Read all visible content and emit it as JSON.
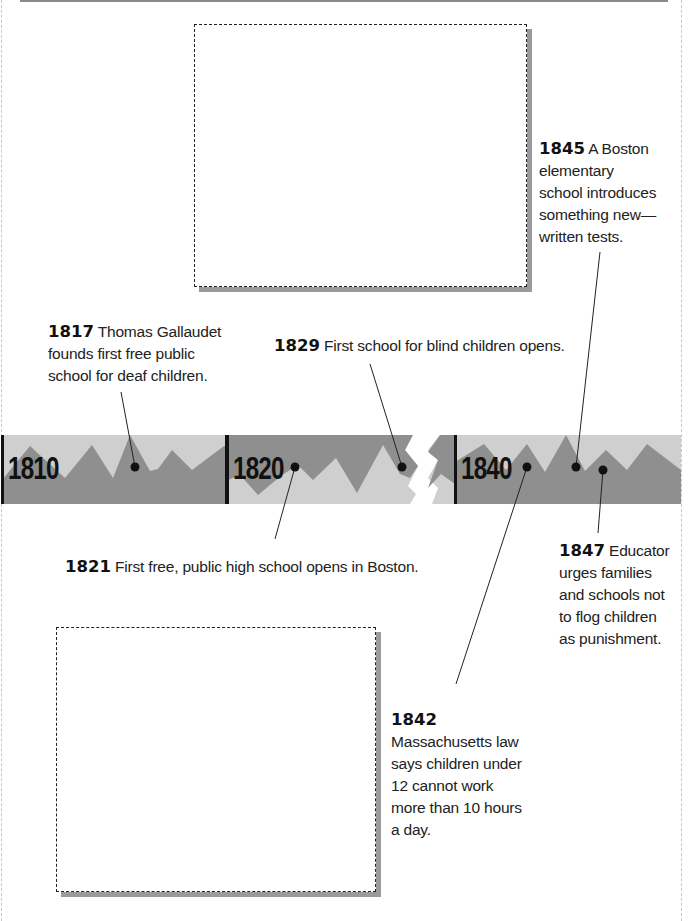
{
  "frame": {
    "border_color": "#c8c8c8",
    "top_rule_color": "#8a8a8a"
  },
  "photo_placeholders": [
    {
      "id": "top-photo",
      "x": 194,
      "y": 24,
      "w": 333,
      "h": 263
    },
    {
      "id": "bottom-photo",
      "x": 56,
      "y": 627,
      "w": 320,
      "h": 265
    }
  ],
  "timeline": {
    "colors": {
      "light": "#cfcfcf",
      "dark": "#8f8f8f",
      "bar": "#111111",
      "dot": "#111111"
    },
    "decades": [
      {
        "label": "1810"
      },
      {
        "label": "1820"
      },
      {
        "label": "1840"
      }
    ]
  },
  "events": [
    {
      "year": "1817",
      "text": "Thomas Gallaudet founds first free public school for deaf children.",
      "lines": [
        "Thomas Gallaudet",
        "founds first free public",
        "school for deaf children."
      ]
    },
    {
      "year": "1829",
      "text": "First school for blind children opens."
    },
    {
      "year": "1845",
      "text": "A Boston elementary school introduces something new—written tests.",
      "lines": [
        "A Boston",
        "elementary",
        "school introduces",
        "something new—",
        "written tests."
      ]
    },
    {
      "year": "1821",
      "text": "First free, public high school opens in Boston."
    },
    {
      "year": "1847",
      "text": "Educator urges families and schools not to flog children as punishment.",
      "lines": [
        "Educator",
        "urges families",
        "and schools not",
        "to flog children",
        "as punishment."
      ]
    },
    {
      "year": "1842",
      "text": "Massachusetts law says children under 12 cannot work more than 10 hours a day.",
      "lines": [
        "Massachusetts law",
        "says children under",
        "12 cannot work",
        "more than 10 hours",
        "a day."
      ]
    }
  ]
}
